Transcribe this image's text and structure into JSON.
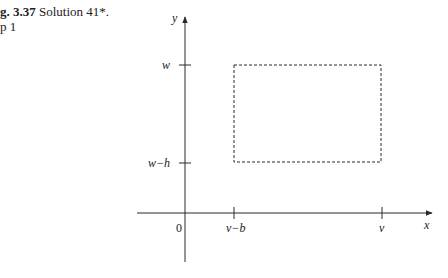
{
  "caption": {
    "figure_label": "g. 3.37",
    "title": "Solution 41*.",
    "step": "p 1"
  },
  "diagram": {
    "axes": {
      "x_label": "x",
      "y_label": "y",
      "origin_label": "0"
    },
    "x_ticks": [
      {
        "label": "v−b"
      },
      {
        "label": "v"
      }
    ],
    "y_ticks": [
      {
        "label": "w"
      },
      {
        "label": "w−h"
      }
    ],
    "rectangle": {
      "style": "dashed",
      "x_from": "v−b",
      "x_to": "v",
      "y_from": "w−h",
      "y_to": "w"
    },
    "colors": {
      "ink": "#2a2a2a",
      "background": "#ffffff"
    }
  }
}
